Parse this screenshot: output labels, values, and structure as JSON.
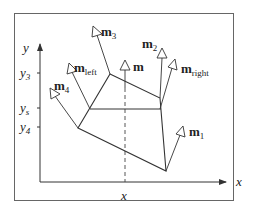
{
  "diagram": {
    "axes": {
      "x_label": "x",
      "y_label": "y",
      "y_ticks": [
        {
          "label": "y",
          "sub": "3"
        },
        {
          "label": "y",
          "sub": "s"
        },
        {
          "label": "y",
          "sub": "4"
        }
      ],
      "x_tick": {
        "label": "x"
      }
    },
    "vectors": [
      {
        "name": "m",
        "sub": "1"
      },
      {
        "name": "m",
        "sub": "2"
      },
      {
        "name": "m",
        "sub": "3"
      },
      {
        "name": "m",
        "sub": "4"
      },
      {
        "name": "m",
        "sub": "left"
      },
      {
        "name": "m",
        "sub": "right"
      },
      {
        "name": "m",
        "sub": ""
      }
    ],
    "colors": {
      "line": "#333333",
      "frame": "#555555",
      "background": "#ffffff"
    }
  }
}
